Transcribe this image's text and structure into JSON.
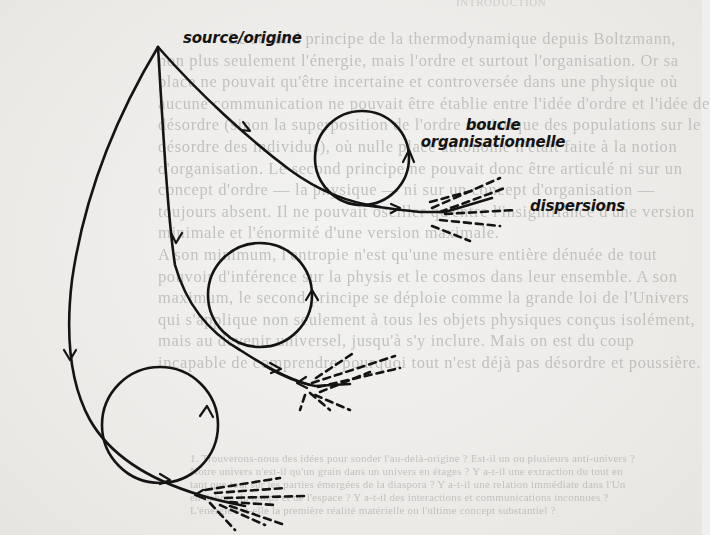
{
  "diagram": {
    "labels": {
      "source": "source/origine",
      "loop_line1": "boucle",
      "loop_line2": "organisationnelle",
      "dispersions": "dispersions"
    },
    "nodes": [
      {
        "id": "source",
        "label": "source/origine"
      },
      {
        "id": "loop-upper",
        "label": "boucle organisationnelle"
      },
      {
        "id": "loop-middle",
        "label": ""
      },
      {
        "id": "loop-lower",
        "label": ""
      },
      {
        "id": "dispersion-upper",
        "label": "dispersions"
      },
      {
        "id": "dispersion-middle",
        "label": ""
      },
      {
        "id": "dispersion-lower",
        "label": ""
      }
    ],
    "edges": [
      {
        "from": "source",
        "to": "loop-upper"
      },
      {
        "from": "loop-upper",
        "to": "dispersion-upper"
      },
      {
        "from": "source",
        "to": "loop-middle"
      },
      {
        "from": "loop-middle",
        "to": "dispersion-middle"
      },
      {
        "from": "source",
        "to": "loop-lower"
      },
      {
        "from": "loop-lower",
        "to": "dispersion-lower"
      }
    ],
    "ink_color": "#141414",
    "paper_color": "#efefed"
  },
  "background_text": {
    "header": "INTRODUCTION",
    "lines": [
      "Le second principe de la thermodynamique depuis Boltzmann,",
      "non plus seulement l'énergie, mais l'ordre et surtout l'organisation. Or sa",
      "place ne pouvait qu'être incertaine et controversée dans une physique où",
      "aucune communication ne pouvait être établie entre l'idée d'ordre et l'idée de",
      "désordre (sinon la superposition de l'ordre statistique des populations sur le",
      "désordre des individus), où nulle place autonome n'était faite à la notion",
      "d'organisation. Le second principe ne pouvait donc être articulé ni sur un",
      "concept d'ordre — la physique — ni sur un concept d'organisation —",
      "toujours absent. Il ne pouvait osciller qu'entre l'insignifiance d'une version",
      "minimale et l'énormité d'une version maximale.",
      "  A son minimum, l'entropie n'est qu'une mesure entière dénuée de tout",
      "pouvoir d'inférence sur la physis et le cosmos dans leur ensemble. A son",
      "maximum, le second principe se déploie comme la grande loi de l'Univers",
      "qui s'applique non seulement à tous les objets physiques conçus isolément,",
      "mais au devenir universel, jusqu'à s'y inclure. Mais on est du coup",
      "incapable de comprendre pourquoi tout n'est déjà pas désordre et poussière."
    ],
    "footnotes": [
      "1. Trouverons-nous des idées pour sonder l'au-delà-origine ? Est-il un ou plusieurs anti-univers ?",
      "Notre univers n'est-il qu'un grain dans un univers en étages ? Y a-t-il une extraction du tout en",
      "tant que tout sur les parties émergées de la diaspora ? Y a-t-il une relation immédiate dans l'Un",
      "en dehors du temps et de l'espace ? Y a-t-il des interactions et communications inconnues ?",
      "L'énergie est-elle la première réalité matérielle ou l'ultime concept substantiel ?"
    ]
  }
}
